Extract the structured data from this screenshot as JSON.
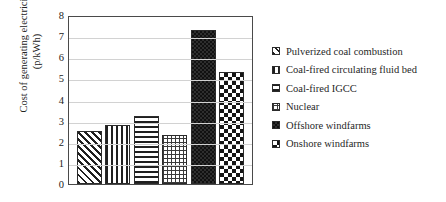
{
  "chart_data": {
    "type": "bar",
    "title": "",
    "xlabel": "",
    "ylabel": "Cost of generating electricity\n(p/kWh)",
    "ylim": [
      0,
      8
    ],
    "ytick_labels": [
      "8",
      "7",
      "6",
      "5",
      "4",
      "3",
      "2",
      "1",
      "0"
    ],
    "ytick_values": [
      8,
      7,
      6,
      5,
      4,
      3,
      2,
      1,
      0
    ],
    "grid": true,
    "legend_position": "right",
    "categories": [
      "Pulverized coal combustion",
      "Coal-fired circulating fluid bed",
      "Coal-fired IGCC",
      "Nuclear",
      "Offshore windfarms",
      "Onshore windfarms"
    ],
    "values": [
      2.5,
      2.8,
      3.2,
      2.3,
      7.3,
      5.3
    ],
    "patterns": [
      "diagonal-stripes",
      "vertical-stripes",
      "horizontal-stripes",
      "fine-grid",
      "dark-checker",
      "checkerboard"
    ]
  },
  "legend": {
    "items": [
      {
        "label": "Pulverized coal combustion",
        "pattern": "diagonal-stripes"
      },
      {
        "label": "Coal-fired circulating fluid bed",
        "pattern": "vertical-stripes"
      },
      {
        "label": "Coal-fired IGCC",
        "pattern": "horizontal-stripes"
      },
      {
        "label": "Nuclear",
        "pattern": "fine-grid"
      },
      {
        "label": "Offshore windfarms",
        "pattern": "dark-checker"
      },
      {
        "label": "Onshore windfarms",
        "pattern": "checkerboard"
      }
    ]
  },
  "colors": {
    "ink": "#1f1f1f",
    "axis": "#4a4a4a",
    "grid": "#d2d2d2",
    "background": "#ffffff"
  }
}
